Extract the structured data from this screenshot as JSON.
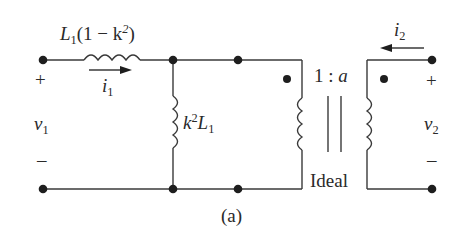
{
  "diagram": {
    "type": "circuit",
    "caption": "(a)",
    "colors": {
      "wire": "#3a3a3a",
      "node": "#1e1e1e",
      "text": "#2a2a2a"
    },
    "series_inductor": {
      "symbol": "L",
      "sub": "1",
      "expr": "(1 − k",
      "sup": "2",
      "close": ")"
    },
    "shunt_inductor": {
      "pre": "k",
      "sup": "2",
      "symbol": "L",
      "sub": "1"
    },
    "current_1": {
      "symbol": "i",
      "sub": "1",
      "direction": "right"
    },
    "current_2": {
      "symbol": "i",
      "sub": "2",
      "direction": "left"
    },
    "voltage_1": {
      "symbol": "v",
      "sub": "1",
      "plus": "+",
      "minus": "–"
    },
    "voltage_2": {
      "symbol": "v",
      "sub": "2",
      "plus": "+",
      "minus": "–"
    },
    "transformer": {
      "ratio_left": "1 : ",
      "ratio_right": "a",
      "label": "Ideal"
    }
  }
}
